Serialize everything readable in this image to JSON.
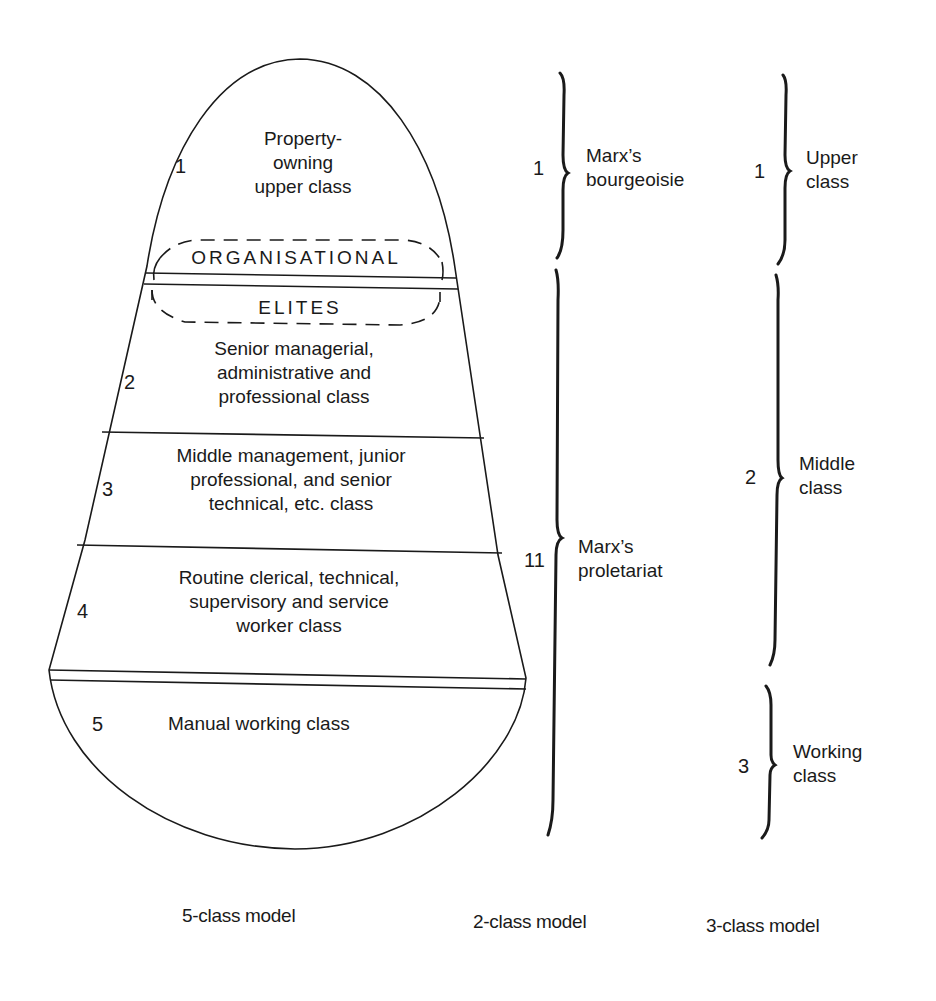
{
  "five_class_model": {
    "caption": "5-class model",
    "layers": [
      {
        "number": "1",
        "lines": [
          "Property-",
          "owning",
          "upper class"
        ]
      },
      {
        "number": "2",
        "lines": [
          "Senior managerial,",
          "administrative and",
          "professional class"
        ]
      },
      {
        "number": "3",
        "lines": [
          "Middle management, junior",
          "professional, and senior",
          "technical, etc. class"
        ]
      },
      {
        "number": "4",
        "lines": [
          "Routine clerical, technical,",
          "supervisory and service",
          "worker class"
        ]
      },
      {
        "number": "5",
        "lines": [
          "Manual working class"
        ]
      }
    ],
    "overlay": {
      "top_word": "ORGANISATIONAL",
      "bottom_word": "ELITES"
    }
  },
  "two_class_model": {
    "caption": "2-class model",
    "groups": [
      {
        "number": "1",
        "lines": [
          "Marx’s",
          "bourgeoisie"
        ]
      },
      {
        "number": "11",
        "lines": [
          "Marx’s",
          "proletariat"
        ]
      }
    ]
  },
  "three_class_model": {
    "caption": "3-class model",
    "groups": [
      {
        "number": "1",
        "lines": [
          "Upper",
          "class"
        ]
      },
      {
        "number": "2",
        "lines": [
          "Middle",
          "class"
        ]
      },
      {
        "number": "3",
        "lines": [
          "Working",
          "class"
        ]
      }
    ]
  },
  "colors": {
    "ink": "#1a1a1a",
    "background": "#ffffff"
  }
}
